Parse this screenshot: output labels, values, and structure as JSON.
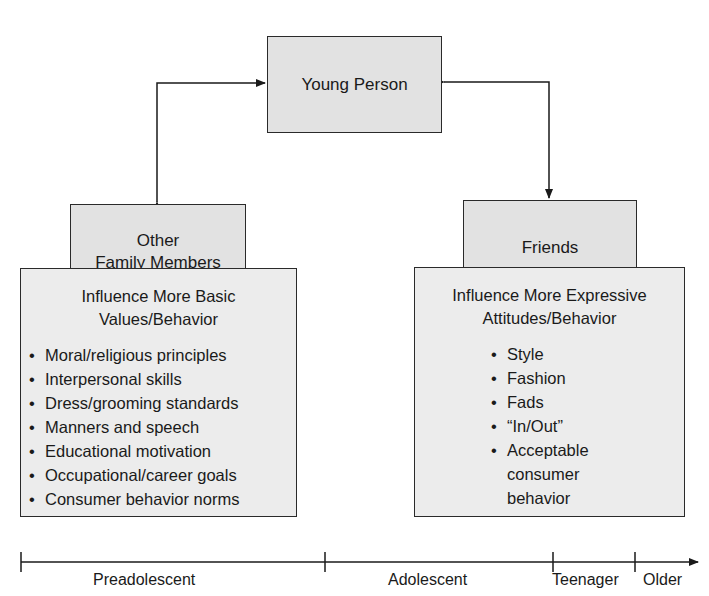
{
  "diagram": {
    "root_node": {
      "label": "Young Person"
    },
    "left_branch": {
      "node": {
        "label_line1": "Other",
        "label_line2": "Family Members"
      },
      "panel": {
        "title_line1": "Influence More Basic",
        "title_line2": "Values/Behavior",
        "items": [
          "Moral/religious principles",
          "Interpersonal skills",
          "Dress/grooming standards",
          "Manners and speech",
          "Educational motivation",
          "Occupational/career goals",
          "Consumer behavior norms"
        ]
      }
    },
    "right_branch": {
      "node": {
        "label": "Friends"
      },
      "panel": {
        "title_line1": "Influence More Expressive",
        "title_line2": "Attitudes/Behavior",
        "items": [
          "Style",
          "Fashion",
          "Fads",
          "“In/Out”",
          "Acceptable consumer behavior"
        ],
        "last_item_lines": [
          "Acceptable",
          "consumer",
          "behavior"
        ]
      }
    },
    "timeline": {
      "stages": [
        "Preadolescent",
        "Adolescent",
        "Teenager",
        "Older"
      ]
    },
    "colors": {
      "box_fill": "#e2e2e2",
      "stroke": "#2a2a2a",
      "background": "#ffffff"
    }
  }
}
